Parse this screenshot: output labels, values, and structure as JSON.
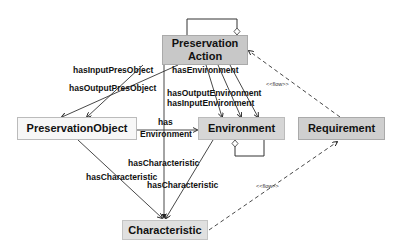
{
  "diagram": {
    "nodes": {
      "preservation_action": {
        "label_line1": "Preservation",
        "label_line2": "Action",
        "fill": "#c8c8c8"
      },
      "preservation_object": {
        "label": "PreservationObject",
        "fill": "#f7f7f7"
      },
      "environment": {
        "label": "Environment",
        "fill": "#d6d6d6"
      },
      "requirement": {
        "label": "Requirement",
        "fill": "#cfcfcf"
      },
      "characteristic": {
        "label": "Characteristic",
        "fill": "#e0e0e0"
      }
    },
    "edges": {
      "has_input_pres_object": "hasInputPresObject",
      "has_output_pres_object": "hasOutputPresObject",
      "has_environment": "hasEnvironment",
      "has_output_environment": "hasOutputEnvironment",
      "has_input_environment": "hasInputEnvironment",
      "po_has_environment_1": "has",
      "po_has_environment_2": "Environment",
      "env_has_characteristic": "hasCharacteristic",
      "po_has_characteristic": "hasCharacteristic",
      "pa_has_characteristic": "hasCharacteristic",
      "flow_req_to_pa": "<<flow>>",
      "flow_char_to_req": "<<flow>>"
    }
  }
}
